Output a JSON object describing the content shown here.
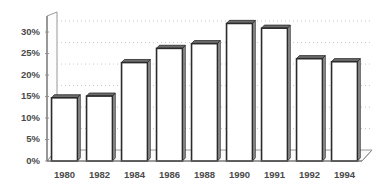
{
  "chart_data": {
    "type": "bar",
    "title": "",
    "subtitle": "",
    "xlabel": "",
    "ylabel": "",
    "categories": [
      "1980",
      "1982",
      "1984",
      "1986",
      "1988",
      "1990",
      "1991",
      "1992",
      "1994"
    ],
    "values": [
      14.7,
      15.1,
      22.9,
      26.2,
      27.3,
      32.0,
      30.9,
      23.8,
      23.1
    ],
    "series": [
      {
        "name": "",
        "values": [
          14.7,
          15.1,
          22.9,
          26.2,
          27.3,
          32.0,
          30.9,
          23.8,
          23.1
        ]
      }
    ],
    "ylim": [
      0,
      33.5
    ],
    "ytick_values": [
      0,
      5,
      10,
      15,
      20,
      25,
      30
    ],
    "ytick_labels": [
      "0%",
      "5%",
      "10%",
      "15%",
      "20%",
      "25%",
      "30%"
    ],
    "xtick_labels": [
      "1980",
      "1982",
      "1984",
      "1986",
      "1988",
      "1990",
      "1991",
      "1992",
      "1994"
    ],
    "grid": true,
    "grid_axis": "y",
    "legend": false,
    "legend_position": "none",
    "annotations": [],
    "style": {
      "bar_fill": "#ffffff",
      "bar_outline": "#2b2b2b",
      "bar_side_shade": "#9a9a9a",
      "bar_top_shade": "#6d6d6d",
      "gridline_color": "#b9b9b9",
      "axis_color": "#6f6f6f",
      "tick_label_color": "#4a4a4a",
      "background": "#ffffff",
      "perspective": "3d-extruded"
    }
  }
}
